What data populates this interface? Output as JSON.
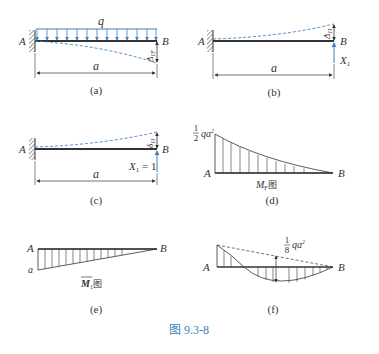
{
  "figure": {
    "caption": "图 9.3-8",
    "accent_color": "#3d7fc0",
    "panels": {
      "a": {
        "caption": "(a)",
        "load_label": "q",
        "point_a": "A",
        "point_b": "B",
        "deflection_label": "Δ",
        "deflection_sub": "1F",
        "length_label": "a"
      },
      "b": {
        "caption": "(b)",
        "point_a": "A",
        "point_b": "B",
        "deflection_label": "Δ",
        "deflection_sub": "11",
        "force_label": "X",
        "force_sub": "1",
        "length_label": "a"
      },
      "c": {
        "caption": "(c)",
        "point_a": "A",
        "point_b": "B",
        "deflection_label": "δ",
        "deflection_sub": "11",
        "force_label": "X",
        "force_sub": "1",
        "force_value": " = 1",
        "length_label": "a"
      },
      "d": {
        "caption": "(d)",
        "point_a": "A",
        "point_b": "B",
        "value_num": "1",
        "value_den": "2",
        "value_expr": "qa",
        "value_exp": "2",
        "diagram_label": "M",
        "diagram_sub": "F",
        "diagram_suffix": "图"
      },
      "e": {
        "caption": "(e)",
        "point_a": "A",
        "point_b": "B",
        "value_label": "a",
        "diagram_label": "M",
        "diagram_sub": "1",
        "diagram_suffix": "图"
      },
      "f": {
        "caption": "(f)",
        "point_a": "A",
        "point_b": "B",
        "value_num": "1",
        "value_den": "8",
        "value_expr": "qa",
        "value_exp": "2"
      }
    }
  }
}
